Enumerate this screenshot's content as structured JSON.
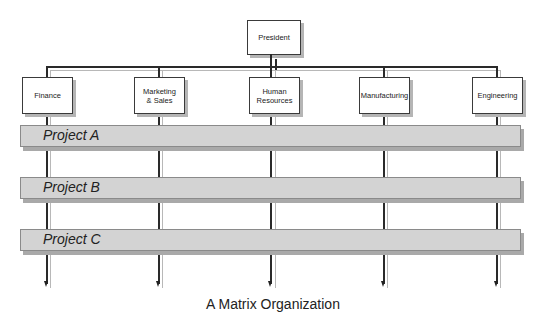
{
  "diagram": {
    "top": {
      "label": "President"
    },
    "departments": [
      {
        "label": "Finance"
      },
      {
        "label": "Marketing & Sales"
      },
      {
        "label": "Human Resources"
      },
      {
        "label": "Manufacturing"
      },
      {
        "label": "Engineering"
      }
    ],
    "projects": [
      {
        "label": "Project A"
      },
      {
        "label": "Project B"
      },
      {
        "label": "Project C"
      }
    ],
    "caption": "A Matrix Organization",
    "colors": {
      "line": "#2a2a2a",
      "box_border": "#3a3a3a",
      "bar_fill": "#d3d3d3",
      "shadow": "#b5b5b5"
    }
  }
}
